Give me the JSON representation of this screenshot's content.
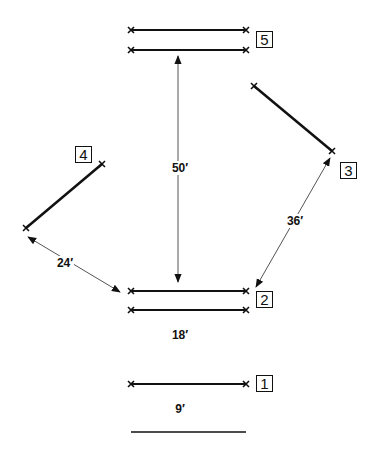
{
  "diagram": {
    "positions": [
      {
        "id": "1",
        "label": "1",
        "box": {
          "x": 256,
          "y": 375
        }
      },
      {
        "id": "2",
        "label": "2",
        "box": {
          "x": 256,
          "y": 290
        }
      },
      {
        "id": "3",
        "label": "3",
        "box": {
          "x": 340,
          "y": 162
        }
      },
      {
        "id": "4",
        "label": "4",
        "box": {
          "x": 75,
          "y": 146
        }
      },
      {
        "id": "5",
        "label": "5",
        "box": {
          "x": 256,
          "y": 31
        }
      }
    ],
    "dimensions": [
      {
        "id": "dim-50",
        "label": "50′",
        "pos": {
          "x": 180,
          "y": 168
        }
      },
      {
        "id": "dim-36",
        "label": "36′",
        "pos": {
          "x": 295,
          "y": 221
        }
      },
      {
        "id": "dim-24",
        "label": "24′",
        "pos": {
          "x": 65,
          "y": 263
        }
      },
      {
        "id": "dim-18",
        "label": "18′",
        "pos": {
          "x": 180,
          "y": 335
        }
      },
      {
        "id": "dim-9",
        "label": "9′",
        "pos": {
          "x": 180,
          "y": 409
        }
      }
    ],
    "colors": {
      "stroke": "#111111",
      "arrow": "#555555",
      "background": "#ffffff"
    }
  }
}
